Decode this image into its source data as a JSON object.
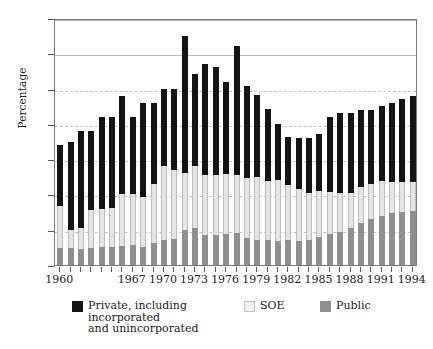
{
  "chart_data": {
    "type": "bar",
    "subtype": "stacked-bar",
    "title": "",
    "xlabel": "",
    "ylabel": "Percentage",
    "ylim": [
      0,
      35
    ],
    "yticks": [
      0,
      5,
      10,
      15,
      20,
      25,
      30,
      35
    ],
    "grid": "horizontal",
    "legend_position": "bottom",
    "categories": [
      "1960",
      "1961",
      "1962",
      "1963",
      "1964",
      "1965",
      "1966",
      "1967",
      "1968",
      "1969",
      "1970",
      "1971",
      "1972",
      "1973",
      "1974",
      "1975",
      "1976",
      "1977",
      "1978",
      "1979",
      "1980",
      "1981",
      "1982",
      "1983",
      "1984",
      "1985",
      "1986",
      "1987",
      "1988",
      "1989",
      "1990",
      "1991",
      "1992",
      "1993",
      "1994"
    ],
    "xtick_labels": [
      "1960",
      "1967",
      "1970",
      "1973",
      "1976",
      "1979",
      "1982",
      "1985",
      "1988",
      "1991",
      "1994"
    ],
    "xtick_categories": [
      "1960",
      "1967",
      "1970",
      "1973",
      "1976",
      "1979",
      "1982",
      "1985",
      "1988",
      "1991",
      "1994"
    ],
    "series": [
      {
        "name": "Public",
        "color": "#8f8f8f",
        "values": [
          2.4,
          2.4,
          2.3,
          2.4,
          2.5,
          2.6,
          2.7,
          2.8,
          2.6,
          3.1,
          3.5,
          3.7,
          5.0,
          5.3,
          4.3,
          4.2,
          4.4,
          4.6,
          3.8,
          3.6,
          3.5,
          3.4,
          3.5,
          3.4,
          3.6,
          3.9,
          4.4,
          4.7,
          5.2,
          5.9,
          6.5,
          7.0,
          7.3,
          7.5,
          7.7
        ]
      },
      {
        "name": "SOE",
        "color": "#e4e4e4",
        "values": [
          6.0,
          2.6,
          2.9,
          5.4,
          5.5,
          5.5,
          7.3,
          7.2,
          7.0,
          8.4,
          10.6,
          9.7,
          8.0,
          8.8,
          8.5,
          8.6,
          8.5,
          8.1,
          8.6,
          8.9,
          8.4,
          8.6,
          7.8,
          7.4,
          6.6,
          6.6,
          6.0,
          5.5,
          5.0,
          5.1,
          5.0,
          4.9,
          4.4,
          4.2,
          4.1
        ]
      },
      {
        "name": "Private, including\nincorporated\nand unincorporated",
        "color": "#141414",
        "values": [
          8.6,
          12.5,
          13.8,
          11.2,
          13.0,
          12.9,
          14.0,
          11.0,
          13.4,
          11.5,
          10.9,
          11.6,
          19.5,
          12.9,
          15.7,
          15.2,
          13.1,
          18.3,
          12.9,
          11.6,
          10.2,
          8.0,
          6.9,
          7.2,
          7.8,
          8.0,
          10.6,
          11.3,
          11.3,
          11.0,
          10.5,
          10.6,
          11.3,
          11.8,
          12.2
        ]
      }
    ],
    "totals": [
      17.0,
      17.5,
      19.0,
      19.0,
      21.0,
      21.0,
      24.0,
      21.0,
      23.0,
      23.0,
      25.0,
      25.0,
      27.0,
      32.5,
      26.7,
      26.0,
      26.0,
      31.0,
      25.3,
      24.1,
      22.1,
      20.0,
      18.2,
      18.0,
      18.0,
      18.5,
      21.0,
      21.5,
      21.5,
      22.0,
      22.0,
      22.5,
      23.0,
      23.5,
      24.0
    ]
  },
  "axes": {
    "y_title": "Percentage",
    "y_tick_labels": [
      "0",
      "5",
      "10",
      "15",
      "20",
      "25",
      "30",
      "35"
    ]
  },
  "legend": {
    "entries": [
      {
        "label": "Private, including\nincorporated\nand unincorporated",
        "color": "#141414",
        "swatch": "private-swatch"
      },
      {
        "label": "SOE",
        "color": "#e4e4e4",
        "swatch": "soe-swatch"
      },
      {
        "label": "Public",
        "color": "#8f8f8f",
        "swatch": "public-swatch"
      }
    ]
  }
}
